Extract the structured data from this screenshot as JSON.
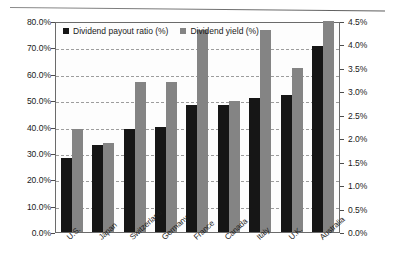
{
  "chart_data": {
    "type": "bar",
    "title": "",
    "xlabel": "",
    "ylabel": "",
    "grid": true,
    "legend_position": "top-left",
    "categories": [
      "U.S.",
      "Japan",
      "Switzerland",
      "Germany",
      "France",
      "Canada",
      "Italy",
      "U.K.",
      "Australia"
    ],
    "series": [
      {
        "name": "Dividend payout ratio (%)",
        "axis": "left",
        "color": "#161616",
        "values": [
          28.0,
          33.0,
          39.0,
          40.0,
          48.0,
          48.0,
          51.0,
          52.0,
          70.5
        ]
      },
      {
        "name": "Dividend yield (%)",
        "axis": "right",
        "color": "#848484",
        "values": [
          1.95,
          1.72,
          2.81,
          2.81,
          3.82,
          2.53,
          3.8,
          3.1,
          4.03
        ]
      }
    ],
    "yaxis_left": {
      "min": 0,
      "max": 80,
      "step": 10,
      "ticks": [
        "0.0%",
        "10.0%",
        "20.0%",
        "30.0%",
        "40.0%",
        "50.0%",
        "60.0%",
        "70.0%",
        "80.0%"
      ]
    },
    "yaxis_right": {
      "min": 0,
      "max": 4.5,
      "step": 0.5,
      "ticks": [
        "0.0%",
        "0.5%",
        "1.0%",
        "1.5%",
        "2.0%",
        "2.5%",
        "3.0%",
        "3.5%",
        "4.0%",
        "4.5%"
      ]
    },
    "yield_display_percent": [
      2.2,
      1.9,
      3.2,
      3.2,
      4.3,
      2.8,
      4.3,
      3.5,
      4.5
    ]
  },
  "legend": {
    "items": [
      {
        "label": "Dividend payout ratio (%)",
        "color": "#161616"
      },
      {
        "label": "Dividend yield (%)",
        "color": "#848484"
      }
    ]
  }
}
